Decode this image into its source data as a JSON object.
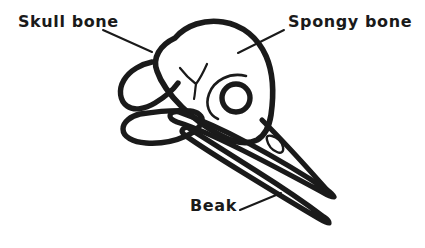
{
  "figure": {
    "style": "hand-drawn line art",
    "background_color": "#ffffff",
    "ink_color": "#1a1a1a",
    "width": 425,
    "height": 248
  },
  "labels": {
    "skull_bone": {
      "text": "Skull bone",
      "x": 18,
      "y": 14
    },
    "spongy_bone": {
      "text": "Spongy bone",
      "x": 288,
      "y": 14
    },
    "beak": {
      "text": "Beak",
      "x": 190,
      "y": 198
    }
  },
  "leader_lines": [
    {
      "name": "leader-skull-bone",
      "from": [
        103,
        30
      ],
      "to": [
        152,
        52
      ]
    },
    {
      "name": "leader-spongy-bone",
      "from": [
        284,
        30
      ],
      "to": [
        238,
        53
      ]
    },
    {
      "name": "leader-beak",
      "from": [
        240,
        210
      ],
      "to": [
        281,
        193
      ]
    }
  ],
  "parts": [
    {
      "name": "cranium",
      "label": "Skull bone",
      "description": "rounded braincase"
    },
    {
      "name": "spongy-bone-region",
      "label": "Spongy bone",
      "description": "upper rear cranium surface"
    },
    {
      "name": "upper-mandible",
      "label": "Beak",
      "description": "long tapering upper bill"
    },
    {
      "name": "lower-mandible",
      "label": "Beak",
      "description": "long tapering lower bill"
    },
    {
      "name": "eye-socket",
      "label": "orbit",
      "description": "thick ring opening"
    },
    {
      "name": "nostril",
      "label": "naris",
      "description": "small oval opening on upper bill"
    },
    {
      "name": "quadrate-loop",
      "label": "quadrate",
      "description": "upper loop at rear of skull"
    },
    {
      "name": "mandible-ramus-loop",
      "label": "ramus",
      "description": "lower loop at rear of skull"
    },
    {
      "name": "suture-mark",
      "label": "suture",
      "description": "small Y shaped line on cranium"
    }
  ]
}
